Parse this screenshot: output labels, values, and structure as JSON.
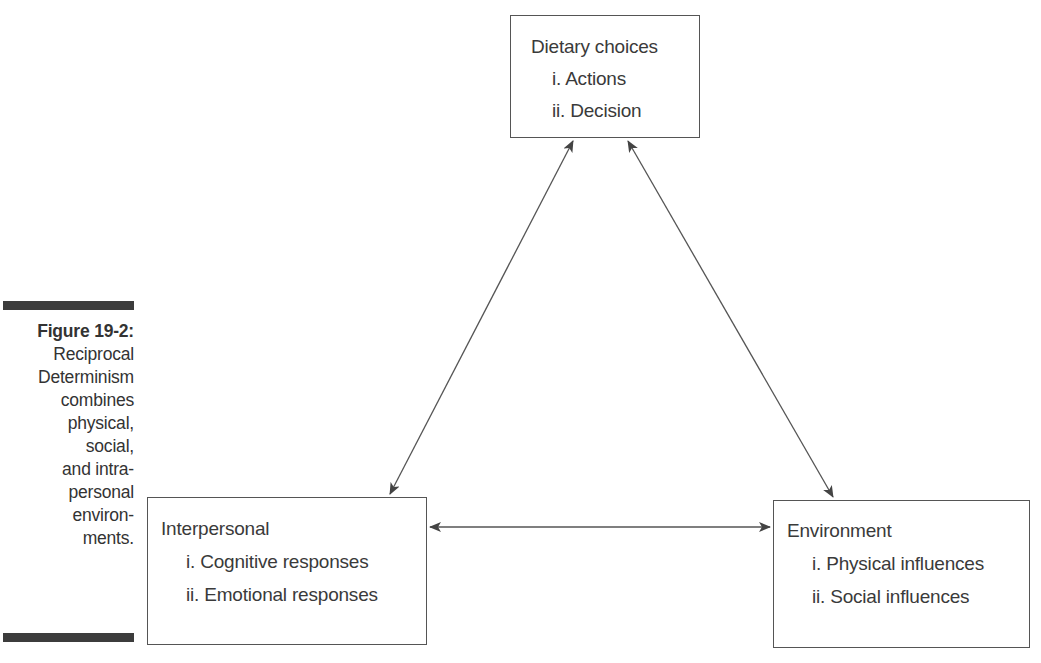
{
  "caption": {
    "figure_label": "Figure 19-2:",
    "lines": [
      "Reciprocal",
      "Determinism",
      "combines",
      "physical,",
      "social,",
      "and intra-",
      "personal",
      "environ-",
      "ments."
    ]
  },
  "nodes": {
    "dietary": {
      "title": "Dietary choices",
      "items": [
        "i. Actions",
        "ii. Decision"
      ]
    },
    "interpersonal": {
      "title": "Interpersonal",
      "items": [
        "i. Cognitive responses",
        "ii. Emotional responses"
      ]
    },
    "environment": {
      "title": "Environment",
      "items": [
        "i. Physical influences",
        "ii. Social influences"
      ]
    }
  },
  "edges": [
    {
      "from": "dietary",
      "to": "interpersonal",
      "type": "bidirectional"
    },
    {
      "from": "dietary",
      "to": "environment",
      "type": "bidirectional"
    },
    {
      "from": "interpersonal",
      "to": "environment",
      "type": "bidirectional"
    }
  ],
  "colors": {
    "line": "#555555",
    "text": "#3a3a3a",
    "bar": "#3c3c3c"
  }
}
